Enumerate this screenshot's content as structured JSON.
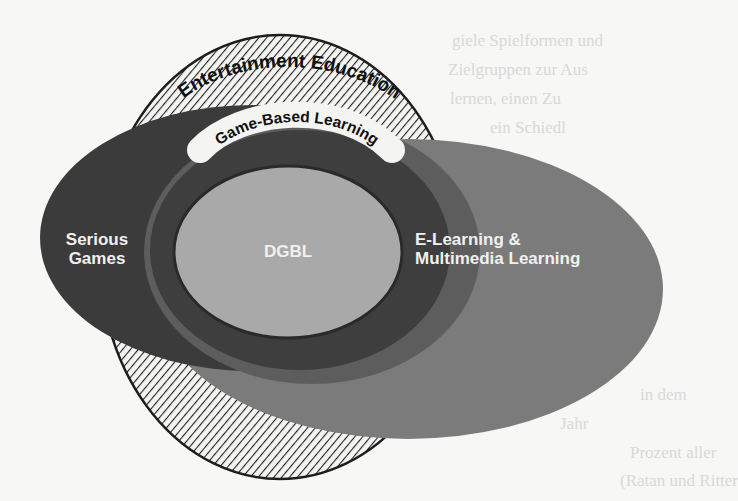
{
  "diagram": {
    "regions": [
      {
        "id": "entertainment-education",
        "label": "Entertainment Education",
        "fill": "hatched",
        "shape": "outer circle"
      },
      {
        "id": "game-based-learning",
        "label": "Game-Based Learning",
        "fill": "#4a4a4a",
        "shape": "ring around DGBL"
      },
      {
        "id": "serious-games",
        "label_line1": "Serious",
        "label_line2": "Games",
        "fill": "#3b3b3b"
      },
      {
        "id": "e-learning",
        "label_line1": "E-Learning &",
        "label_line2": "Multimedia Learning",
        "fill": "#7b7b7b"
      },
      {
        "id": "dgbl",
        "label": "DGBL",
        "fill": "#a9a9a9"
      }
    ],
    "colors": {
      "background": "#f7f7f5",
      "outline": "#1e1e1e",
      "hatch": "#222222",
      "label_text": "#f0f0f0",
      "banner": "#f4f4f2"
    }
  },
  "labels": {
    "entertainment_education": "Entertainment Education",
    "game_based_learning": "Game-Based Learning",
    "serious_1": "Serious",
    "serious_2": "Games",
    "dgbl": "DGBL",
    "elearning_1": "E-Learning &",
    "elearning_2": "Multimedia Learning"
  },
  "background_bleed_text": [
    "giele Spielformen und",
    "Zielgruppen zur Aus",
    "lernen, einen Zu",
    "ein Schiedl",
    "in dem",
    "Jahr",
    "Prozent aller",
    "(Ratan und Ritter",
    "Interventionen der Kategorie"
  ]
}
